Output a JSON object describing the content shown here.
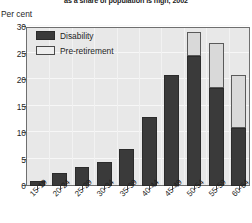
{
  "chart_data": {
    "type": "bar",
    "title": "as a share of population is high, 2002",
    "subtitle": "",
    "ylabel": "Per cent",
    "xlabel": "",
    "ylim": [
      0,
      30
    ],
    "yticks": [
      0,
      5,
      10,
      15,
      20,
      25,
      30
    ],
    "grid": true,
    "stacked": true,
    "legend_position": "top-left",
    "categories": [
      "15-19",
      "20-24",
      "25-29",
      "30-34",
      "35-39",
      "40-44",
      "45-49",
      "50-54",
      "55-59",
      "60-64"
    ],
    "series": [
      {
        "name": "Disability",
        "color": "#3a3a3a",
        "values": [
          1.0,
          2.5,
          3.5,
          4.5,
          7.0,
          13.0,
          21.0,
          24.5,
          18.5,
          11.0
        ]
      },
      {
        "name": "Pre-retirement",
        "color": "#d9d9d9",
        "values": [
          0,
          0,
          0,
          0,
          0,
          0,
          0,
          4.5,
          8.5,
          10.0
        ]
      }
    ],
    "totals": [
      1.0,
      2.5,
      3.5,
      4.5,
      7.0,
      13.0,
      21.0,
      29.0,
      27.0,
      21.0
    ]
  },
  "legend": {
    "items": [
      {
        "label": "Disability"
      },
      {
        "label": "Pre-retirement"
      }
    ]
  },
  "axis": {
    "y_unit_label": "Per cent"
  }
}
